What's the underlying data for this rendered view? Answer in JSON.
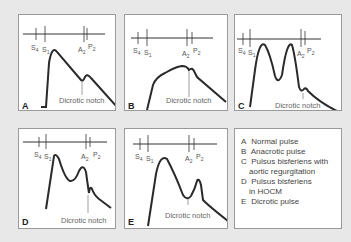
{
  "figure": {
    "panels": [
      {
        "letter": "A",
        "notch_label": "Dicrotic notch",
        "markers": [
          "S4",
          "S1",
          "A2",
          "P2"
        ]
      },
      {
        "letter": "B",
        "notch_label": "Dicrotic notch",
        "markers": [
          "S4",
          "S1",
          "A2",
          "P2"
        ]
      },
      {
        "letter": "C",
        "notch_label": "Dicrotic notch",
        "markers": [
          "S4",
          "S1",
          "A2",
          "P2"
        ]
      },
      {
        "letter": "D",
        "notch_label": "Dicrotic notch",
        "markers": [
          "S4",
          "S1",
          "A2",
          "P2"
        ]
      },
      {
        "letter": "E",
        "notch_label": "Dicrotic notch",
        "markers": [
          "S4",
          "S1",
          "A2",
          "P2"
        ]
      }
    ],
    "legend": [
      {
        "key": "A",
        "text": "Normal pulse"
      },
      {
        "key": "B",
        "text": "Anacrotic pulse"
      },
      {
        "key": "C",
        "text": "Pulsus bisferiens with",
        "text2": "aortic regurgitation"
      },
      {
        "key": "D",
        "text": "Pulsus bisferiens",
        "text2": "in HOCM"
      },
      {
        "key": "E",
        "text": "Dicrotic pulse"
      }
    ]
  }
}
